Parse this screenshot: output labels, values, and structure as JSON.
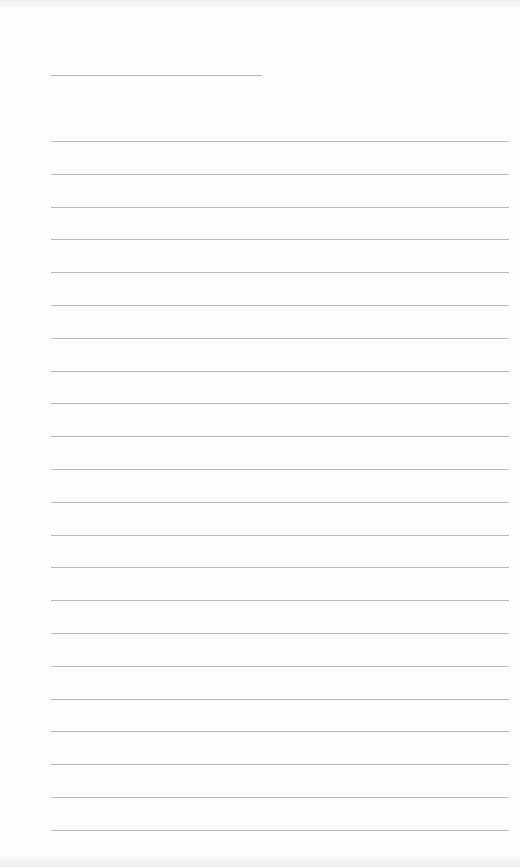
{
  "page": {
    "type": "lined-paper",
    "background": "#fdfdfd",
    "rule_color": "#b8b8b8",
    "header_line": {
      "left": 51,
      "top": 75,
      "width": 211
    },
    "rules": {
      "count": 22,
      "first_top": 141,
      "spacing": 32.8,
      "left": 51,
      "width": 458
    }
  }
}
